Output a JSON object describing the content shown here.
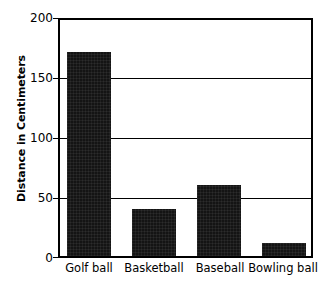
{
  "chart_data": {
    "type": "bar",
    "title": "",
    "subtitle": "",
    "xlabel": "",
    "ylabel": "Distance in Centimeters",
    "categories": [
      "Golf ball",
      "Basketball",
      "Baseball",
      "Bowling ball"
    ],
    "values": [
      173,
      40,
      60,
      11
    ],
    "ylim": [
      0,
      200
    ],
    "y_ticks": [
      200,
      150,
      100,
      50,
      0
    ],
    "y_tick_labels": [
      "200",
      "150",
      "100",
      "50",
      "0"
    ],
    "grid": true,
    "grid_axis": "y",
    "legend": null,
    "legend_position": "none",
    "annotations": [],
    "series": [
      {
        "name": "Distance in Centimeters",
        "color": "#141414",
        "values": [
          173,
          40,
          60,
          11
        ]
      }
    ],
    "colors": {
      "bar": "#141414",
      "axis": "#000000",
      "grid": "#000000",
      "background": "#ffffff",
      "text": "#000000"
    }
  }
}
